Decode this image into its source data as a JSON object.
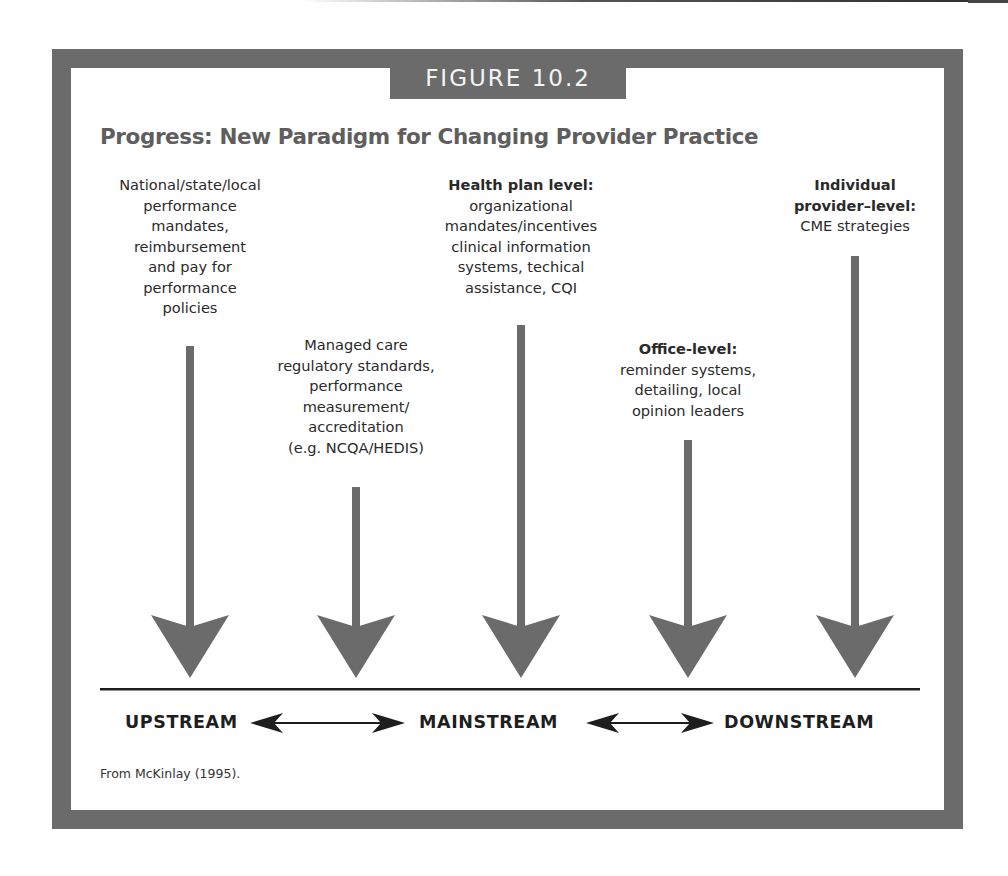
{
  "figure": {
    "label": "FIGURE 10.2",
    "title": "Progress: New Paradigm for Changing Provider Practice",
    "source": "From McKinlay (1995).",
    "frame_color": "#6b6b6b",
    "arrow_color": "#6b6b6b"
  },
  "columns": [
    {
      "id": "national",
      "heading": "",
      "lines": [
        "National/state/local",
        "performance",
        "mandates,",
        "reimbursement",
        "and pay for",
        "performance",
        "policies"
      ],
      "arrow_x": 190,
      "shaft_top": 346
    },
    {
      "id": "managed-care",
      "heading": "",
      "lines": [
        "Managed care",
        "regulatory standards,",
        "performance",
        "measurement/",
        "accreditation",
        "(e.g. NCQA/HEDIS)"
      ],
      "arrow_x": 356,
      "shaft_top": 487
    },
    {
      "id": "health-plan",
      "heading": "Health plan level:",
      "lines": [
        "organizational",
        "mandates/incentives",
        "clinical information",
        "systems, techical",
        "assistance, CQI"
      ],
      "arrow_x": 521,
      "shaft_top": 325
    },
    {
      "id": "office",
      "heading": "Office-level:",
      "lines": [
        "reminder systems,",
        "detailing, local",
        "opinion leaders"
      ],
      "arrow_x": 688,
      "shaft_top": 440
    },
    {
      "id": "individual",
      "heading": "Individual provider–level:",
      "heading_lines": [
        "Individual",
        "provider–level:"
      ],
      "lines": [
        "CME strategies"
      ],
      "arrow_x": 855,
      "shaft_top": 256
    }
  ],
  "axis": {
    "labels": [
      "UPSTREAM",
      "MAINSTREAM",
      "DOWNSTREAM"
    ],
    "connector": "double-headed arrow"
  }
}
